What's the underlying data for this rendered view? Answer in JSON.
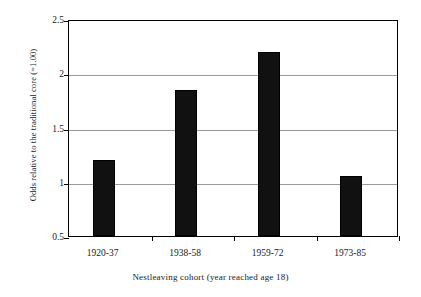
{
  "chart_data": {
    "type": "bar",
    "title": "",
    "subtitle": "",
    "xlabel": "Nestleaving cohort (year reached age 18)",
    "ylabel": "Odds relative to the traditional core (=1.00)",
    "categories": [
      "1920-37",
      "1938-58",
      "1959-72",
      "1973-85"
    ],
    "values": [
      1.2,
      1.85,
      2.2,
      1.05
    ],
    "series": [
      {
        "name": "Odds relative to the traditional core",
        "values": [
          1.2,
          1.85,
          2.2,
          1.05
        ]
      }
    ],
    "ylim": [
      0.5,
      2.5
    ],
    "yticks": [
      0.5,
      1,
      1.5,
      2,
      2.5
    ],
    "ytick_labels": [
      "0.5",
      "1",
      "1.5",
      "2",
      "2.5"
    ],
    "grid": "horizontal",
    "legend": "none",
    "bar_color": "#111111",
    "gridline_color": "#9a9a9a",
    "axis_color": "#000000",
    "background_color": "#ffffff"
  }
}
